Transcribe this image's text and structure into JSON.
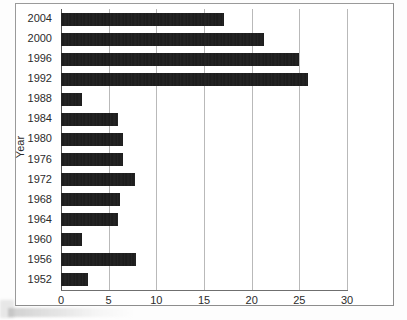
{
  "chart": {
    "ytitle": "Year"
  },
  "chart_data": {
    "type": "bar",
    "orientation": "horizontal",
    "title": "",
    "xlabel": "",
    "ylabel": "Year",
    "xlim": [
      0,
      30
    ],
    "ylim": null,
    "grid": true,
    "legend": false,
    "xticks": [
      0,
      5,
      10,
      15,
      20,
      25,
      30
    ],
    "xticklabels": [
      "0",
      "5",
      "10",
      "15",
      "20",
      "25",
      "30"
    ],
    "categories": [
      "2004",
      "2000",
      "1996",
      "1992",
      "1988",
      "1984",
      "1980",
      "1976",
      "1972",
      "1968",
      "1964",
      "1960",
      "1956",
      "1952"
    ],
    "values": [
      17.1,
      21.3,
      25.0,
      25.9,
      2.2,
      6.0,
      6.5,
      6.5,
      7.8,
      6.2,
      6.0,
      2.2,
      7.9,
      2.8
    ],
    "bar_color": "#1b1b1b",
    "grid_color": "#b9b9b9"
  }
}
